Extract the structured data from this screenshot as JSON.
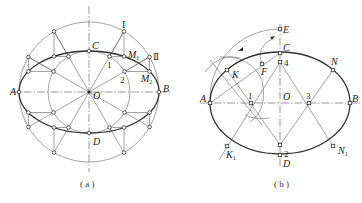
{
  "figure_a": {
    "caption": "( a )",
    "labels": {
      "A": "A",
      "B": "B",
      "C": "C",
      "D": "D",
      "O": "O",
      "M1": "M",
      "M1_sub": "1",
      "M2": "M",
      "M2_sub": "2",
      "roman1": "Ⅰ",
      "roman2": "Ⅱ",
      "n1": "1",
      "n2": "2"
    },
    "description": "Ellipse constructed by concentric-circle method: major circle radius a, minor circle radius b, 12 radial lines"
  },
  "figure_b": {
    "caption": "( b )",
    "labels": {
      "A": "A",
      "B": "B",
      "C": "C",
      "D": "D",
      "O": "O",
      "E": "E",
      "F": "F",
      "K": "K",
      "K1": "K",
      "K1_sub": "1",
      "N": "N",
      "N1": "N",
      "N1_sub": "1",
      "n1": "1",
      "n2": "2",
      "n3": "3",
      "n4": "4"
    },
    "description": "Approximate ellipse by four-center arc method"
  },
  "colors": {
    "line": "#666666",
    "curve": "#333333",
    "background": "#ffffff"
  }
}
